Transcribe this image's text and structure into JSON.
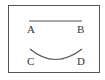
{
  "diagram": {
    "segment_line": {
      "from": "A",
      "to": "B",
      "type": "straight"
    },
    "arc_line": {
      "from": "C",
      "to": "D",
      "type": "curve"
    },
    "labels": {
      "a": "A",
      "b": "B",
      "c": "C",
      "d": "D"
    },
    "colors": {
      "stroke": "#555555",
      "border": "#555555",
      "text": "#333333"
    }
  }
}
